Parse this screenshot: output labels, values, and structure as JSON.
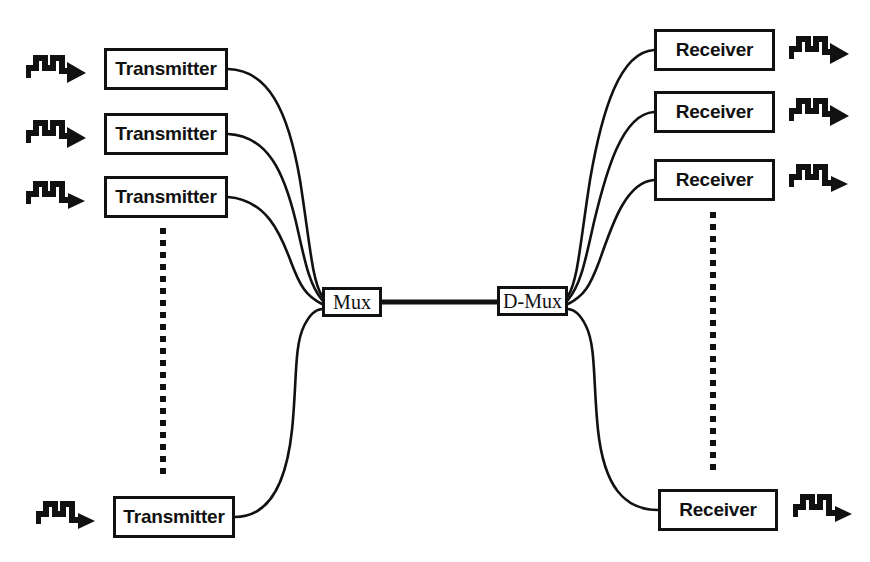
{
  "diagram": {
    "type": "block-diagram",
    "background_color": "#ffffff",
    "line_color": "#111111",
    "canvas": {
      "width": 870,
      "height": 562
    }
  },
  "nodes": {
    "transmitters": [
      {
        "id": "tx1",
        "label": "Transmitter",
        "x": 104,
        "y": 48,
        "w": 124,
        "h": 42
      },
      {
        "id": "tx2",
        "label": "Transmitter",
        "x": 104,
        "y": 113,
        "w": 124,
        "h": 42
      },
      {
        "id": "tx3",
        "label": "Transmitter",
        "x": 104,
        "y": 176,
        "w": 124,
        "h": 42
      },
      {
        "id": "txN",
        "label": "Transmitter",
        "x": 113,
        "y": 496,
        "w": 122,
        "h": 42
      }
    ],
    "receivers": [
      {
        "id": "rx1",
        "label": "Receiver",
        "x": 654,
        "y": 29,
        "w": 121,
        "h": 42
      },
      {
        "id": "rx2",
        "label": "Receiver",
        "x": 654,
        "y": 91,
        "w": 121,
        "h": 42
      },
      {
        "id": "rx3",
        "label": "Receiver",
        "x": 654,
        "y": 159,
        "w": 121,
        "h": 42
      },
      {
        "id": "rxN",
        "label": "Receiver",
        "x": 658,
        "y": 489,
        "w": 120,
        "h": 42
      }
    ],
    "mux": {
      "id": "mux",
      "label": "Mux",
      "x": 322,
      "y": 287,
      "w": 60,
      "h": 30
    },
    "dmux": {
      "id": "dmux",
      "label": "D-Mux",
      "x": 497,
      "y": 286,
      "w": 71,
      "h": 30
    }
  },
  "signal_icons": {
    "name": "square-wave-arrow-icon",
    "pulse_count": 2,
    "inputs": [
      {
        "for": "tx1",
        "x": 26,
        "y": 50
      },
      {
        "for": "tx2",
        "x": 26,
        "y": 115
      },
      {
        "for": "tx3",
        "x": 26,
        "y": 178
      },
      {
        "for": "txN",
        "x": 36,
        "y": 498
      }
    ],
    "outputs": [
      {
        "for": "rx1",
        "x": 789,
        "y": 31
      },
      {
        "for": "rx2",
        "x": 789,
        "y": 93
      },
      {
        "for": "rx3",
        "x": 789,
        "y": 161
      },
      {
        "for": "rxN",
        "x": 793,
        "y": 491
      }
    ]
  },
  "ellipsis": {
    "name": "vertical-dotted-continuation",
    "columns": [
      {
        "side": "transmitters",
        "x": 160,
        "y_start": 228,
        "y_end": 482
      },
      {
        "side": "receivers",
        "x": 710,
        "y_start": 212,
        "y_end": 476
      }
    ]
  },
  "links": {
    "tx_to_mux": [
      {
        "from": "tx1",
        "to": "mux"
      },
      {
        "from": "tx2",
        "to": "mux"
      },
      {
        "from": "tx3",
        "to": "mux"
      },
      {
        "from": "txN",
        "to": "mux"
      }
    ],
    "trunk": {
      "from": "mux",
      "to": "dmux",
      "label": ""
    },
    "dmux_to_rx": [
      {
        "from": "dmux",
        "to": "rx1"
      },
      {
        "from": "dmux",
        "to": "rx2"
      },
      {
        "from": "dmux",
        "to": "rx3"
      },
      {
        "from": "dmux",
        "to": "rxN"
      }
    ]
  }
}
